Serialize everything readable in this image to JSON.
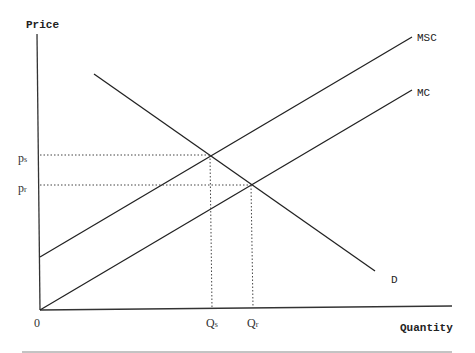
{
  "diagram": {
    "type": "supply-demand-externality",
    "y_axis_label": "Price",
    "x_axis_label": "Quantity",
    "origin_label": "0",
    "curves": [
      {
        "name": "MSC",
        "label": "MSC"
      },
      {
        "name": "MC",
        "label": "MC"
      },
      {
        "name": "D",
        "label": "D"
      }
    ],
    "price_ticks": [
      {
        "label": "p",
        "sub": "s"
      },
      {
        "label": "p",
        "sub": "r"
      }
    ],
    "quantity_ticks": [
      {
        "label": "Q",
        "sub": "s"
      },
      {
        "label": "Q",
        "sub": "r"
      }
    ]
  }
}
